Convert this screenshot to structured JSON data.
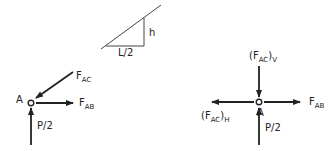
{
  "geometry_inset": {
    "height_label": "h",
    "base_label": "L/2"
  },
  "left_fbd": {
    "joint_label": "A",
    "forces": [
      {
        "name": "F",
        "sub": "AC",
        "direction": "down-left into joint"
      },
      {
        "name": "F",
        "sub": "AB",
        "direction": "right"
      },
      {
        "name": "P/2",
        "sub": "",
        "direction": "up"
      }
    ],
    "fac_main": "F",
    "fac_sub": "AC",
    "fab_main": "F",
    "fab_sub": "AB",
    "p_label": "P/2"
  },
  "right_fbd": {
    "joint_label": "A",
    "fac_v_open": "(F",
    "fac_v_sub": "AC",
    "fac_v_close": ")",
    "fac_v_comp": "V",
    "fac_h_open": "(F",
    "fac_h_sub": "AC",
    "fac_h_close": ")",
    "fac_h_comp": "H",
    "fab_main": "F",
    "fab_sub": "AB",
    "p_label": "P/2"
  },
  "colors": {
    "stroke": "#222222",
    "background": "#ffffff"
  }
}
